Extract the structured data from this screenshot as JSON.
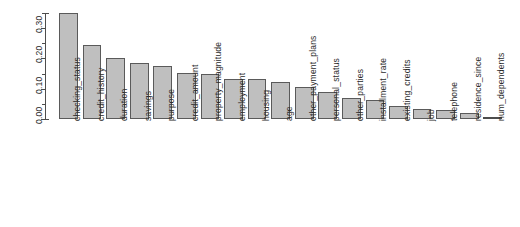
{
  "chart_data": {
    "type": "bar",
    "title": "",
    "subtitle": "",
    "xlabel": "",
    "ylabel": "",
    "ylim": [
      0.0,
      0.35
    ],
    "grid": false,
    "legend": null,
    "orientation": "vertical",
    "bar_color": "#bfbfbf",
    "bar_border_color": "#5a5a5a",
    "axis_color": "#4d4d4d",
    "background_color": "#ffffff",
    "y_ticks": [
      "0.00",
      "0.10",
      "0.20",
      "0.30"
    ],
    "y_tick_values": [
      0.0,
      0.1,
      0.2,
      0.3
    ],
    "y_minor_tick_values": [
      0.05,
      0.15,
      0.25,
      0.35
    ],
    "categories": [
      "checking_status",
      "credit_history",
      "duration",
      "savings",
      "purpose",
      "credit_amount",
      "property_magnitude",
      "employment",
      "housing",
      "age",
      "other_payment_plans",
      "personal_status",
      "other_parties",
      "installment_rate",
      "existing_credits",
      "job",
      "telephone",
      "residence_since",
      "num_dependents"
    ],
    "values": [
      0.349,
      0.245,
      0.203,
      0.185,
      0.176,
      0.151,
      0.149,
      0.133,
      0.131,
      0.123,
      0.106,
      0.088,
      0.071,
      0.062,
      0.042,
      0.034,
      0.029,
      0.021,
      0.002
    ]
  }
}
